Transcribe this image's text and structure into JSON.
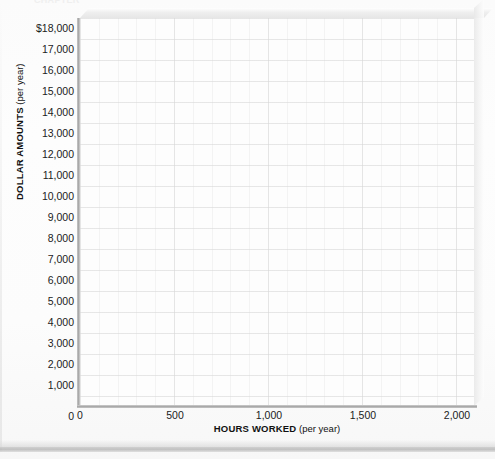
{
  "figure": {
    "top_cut_label": "CHAPTER",
    "background_color": "#fdfdfd",
    "axis_color": "#a9a9a9",
    "grid_color": "#d2d2d2",
    "text_color": "#1b1b1b"
  },
  "chart_data": {
    "type": "line",
    "title": "",
    "subtitle": "",
    "xlabel_strong": "HOURS WORKED",
    "xlabel_light": "(per year)",
    "ylabel_strong": "DOLLAR AMOUNTS",
    "ylabel_light": "(per year)",
    "xlim": [
      0,
      2000
    ],
    "ylim": [
      0,
      18000
    ],
    "grid": true,
    "legend": "none",
    "x_ticks": [
      0,
      500,
      1000,
      1500,
      2000
    ],
    "x_tick_labels": [
      "0",
      "500",
      "1,000",
      "1,500",
      "2,000"
    ],
    "y_ticks": [
      0,
      1000,
      2000,
      3000,
      4000,
      5000,
      6000,
      7000,
      8000,
      9000,
      10000,
      11000,
      12000,
      13000,
      14000,
      15000,
      16000,
      17000,
      18000
    ],
    "y_tick_labels": [
      "$18,000",
      "17,000",
      "16,000",
      "15,000",
      "14,000",
      "13,000",
      "12,000",
      "11,000",
      "10,000",
      "9,000",
      "8,000",
      "7,000",
      "6,000",
      "5,000",
      "4,000",
      "3,000",
      "2,000",
      "1,000",
      "0"
    ],
    "series": [],
    "values": [],
    "categories": [],
    "note": "Blank plotting grid — no data series are drawn in the figure."
  },
  "y_axis": {
    "ticks": [
      {
        "label": "$18,000",
        "top": 23
      },
      {
        "label": "17,000",
        "top": 44
      },
      {
        "label": "16,000",
        "top": 65
      },
      {
        "label": "15,000",
        "top": 86
      },
      {
        "label": "14,000",
        "top": 107
      },
      {
        "label": "13,000",
        "top": 128
      },
      {
        "label": "12,000",
        "top": 149
      },
      {
        "label": "11,000",
        "top": 170
      },
      {
        "label": "10,000",
        "top": 191
      },
      {
        "label": "9,000",
        "top": 212
      },
      {
        "label": "8,000",
        "top": 233
      },
      {
        "label": "7,000",
        "top": 254
      },
      {
        "label": "6,000",
        "top": 275
      },
      {
        "label": "5,000",
        "top": 296
      },
      {
        "label": "4,000",
        "top": 317
      },
      {
        "label": "3,000",
        "top": 338
      },
      {
        "label": "2,000",
        "top": 359
      },
      {
        "label": "1,000",
        "top": 380
      },
      {
        "label": "0",
        "top": 411
      }
    ]
  },
  "x_axis": {
    "ticks": [
      {
        "label": "0",
        "left": 80
      },
      {
        "label": "500",
        "left": 175
      },
      {
        "label": "1,000",
        "left": 269
      },
      {
        "label": "1,500",
        "left": 363
      },
      {
        "label": "2,000",
        "left": 457
      }
    ]
  }
}
